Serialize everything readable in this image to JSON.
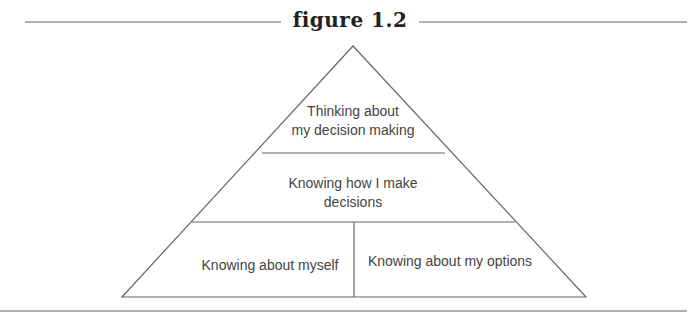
{
  "figure": {
    "title": "figure 1.2",
    "line_color": "#666666",
    "text_color": "#444444"
  },
  "pyramid": {
    "levels": [
      {
        "id": "top",
        "lines": [
          "Thinking about",
          "my decision making"
        ]
      },
      {
        "id": "middle",
        "lines": [
          "Knowing how I make",
          "decisions"
        ]
      },
      {
        "id": "bottom-left",
        "lines": [
          "Knowing about myself"
        ]
      },
      {
        "id": "bottom-right",
        "lines": [
          "Knowing about my options"
        ]
      }
    ]
  }
}
